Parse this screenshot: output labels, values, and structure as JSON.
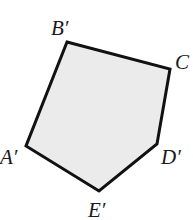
{
  "diagram": {
    "type": "polygon",
    "fill_color": "#ebebeb",
    "stroke_color": "#111111",
    "stroke_width": 3,
    "vertices": [
      {
        "name": "B'",
        "x": 67,
        "y": 42,
        "label": "B′",
        "label_x": 51,
        "label_y": 35
      },
      {
        "name": "C",
        "x": 170,
        "y": 69,
        "label": "C",
        "label_x": 175,
        "label_y": 69
      },
      {
        "name": "D'",
        "x": 157,
        "y": 144,
        "label": "D′",
        "label_x": 161,
        "label_y": 164
      },
      {
        "name": "E'",
        "x": 99,
        "y": 191,
        "label": "E′",
        "label_x": 88,
        "label_y": 217
      },
      {
        "name": "A'",
        "x": 26,
        "y": 146,
        "label": "A′",
        "label_x": 0,
        "label_y": 164
      }
    ]
  }
}
